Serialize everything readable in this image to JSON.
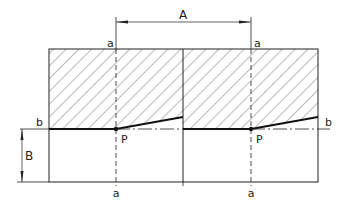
{
  "diagram": {
    "type": "technical-drawing",
    "labels": {
      "dim_A": "A",
      "dim_B": "B",
      "section_a_top_left": "a",
      "section_a_top_right": "a",
      "section_a_bottom_left": "a",
      "section_a_bottom_right": "a",
      "line_b_left": "b",
      "line_b_right": "b",
      "point_P_left": "P",
      "point_P_right": "P"
    },
    "colors": {
      "line": "#222222",
      "hatch": "#555555",
      "background": "#ffffff"
    }
  }
}
